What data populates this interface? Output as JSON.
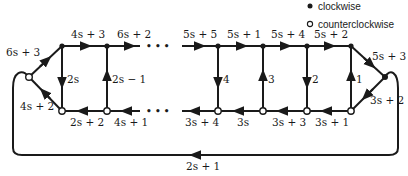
{
  "legend": {
    "filled": {
      "icon": "filled-circle",
      "label": "clockwise"
    },
    "hollow": {
      "icon": "hollow-circle",
      "label": "counterclockwise"
    }
  },
  "nodes": {
    "left": {
      "type": "hollow",
      "x": 29,
      "y": 77
    },
    "right": {
      "type": "filled",
      "x": 385,
      "y": 77
    },
    "top": [
      {
        "type": "filled",
        "x": 62,
        "y": 46
      },
      {
        "type": "filled",
        "x": 107,
        "y": 46
      },
      {
        "type": "filled",
        "x": 218,
        "y": 46
      },
      {
        "type": "filled",
        "x": 263,
        "y": 46
      },
      {
        "type": "filled",
        "x": 307,
        "y": 46
      },
      {
        "type": "filled",
        "x": 351,
        "y": 46
      }
    ],
    "bottom": [
      {
        "type": "hollow",
        "x": 62,
        "y": 111
      },
      {
        "type": "hollow",
        "x": 107,
        "y": 111
      },
      {
        "type": "hollow",
        "x": 218,
        "y": 111
      },
      {
        "type": "hollow",
        "x": 263,
        "y": 111
      },
      {
        "type": "hollow",
        "x": 307,
        "y": 111
      },
      {
        "type": "hollow",
        "x": 351,
        "y": 111
      }
    ]
  },
  "edges": {
    "diag_left_top": {
      "label": "6s + 3",
      "direction": "left-node to top-1"
    },
    "diag_left_bottom": {
      "label": "4s + 2",
      "direction": "bottom-1 to left-node"
    },
    "diag_right_top": {
      "label": "5s + 3",
      "direction": "top-6 to right-node"
    },
    "diag_right_bottom": {
      "label": "3s + 2",
      "direction": "right-node to bottom-6"
    },
    "top": [
      {
        "label": "4s + 3",
        "direction": "right"
      },
      {
        "label": "6s + 2",
        "direction": "right"
      },
      {
        "label": "5s + 5",
        "direction": "right"
      },
      {
        "label": "5s + 1",
        "direction": "right"
      },
      {
        "label": "5s + 4",
        "direction": "right"
      },
      {
        "label": "5s + 2",
        "direction": "right"
      }
    ],
    "bottom": [
      {
        "label": "2s + 2",
        "direction": "left"
      },
      {
        "label": "4s + 1",
        "direction": "left"
      },
      {
        "label": "3s + 4",
        "direction": "left"
      },
      {
        "label": "3s",
        "direction": "left"
      },
      {
        "label": "3s + 3",
        "direction": "left"
      },
      {
        "label": "3s + 1",
        "direction": "left"
      }
    ],
    "vertical": [
      {
        "label": "2s",
        "direction": "down"
      },
      {
        "label": "2s − 1",
        "direction": "up"
      },
      {
        "label": "4",
        "direction": "down"
      },
      {
        "label": "3",
        "direction": "up"
      },
      {
        "label": "2",
        "direction": "down"
      },
      {
        "label": "1",
        "direction": "up"
      }
    ],
    "outer_loop": {
      "label": "2s + 1",
      "direction": "left along bottom"
    }
  },
  "ellipsis": {
    "top": "• • •",
    "bottom": "• • •"
  }
}
